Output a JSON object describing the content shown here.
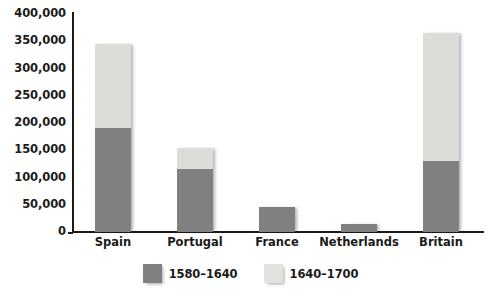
{
  "chart_data": {
    "type": "bar",
    "subtype": "stacked",
    "title": "",
    "xlabel": "",
    "ylabel": "",
    "categories": [
      "Spain",
      "Portugal",
      "France",
      "Netherlands",
      "Britain"
    ],
    "series": [
      {
        "name": "1580–1640",
        "color": "#808080",
        "values": [
          190000,
          115000,
          45000,
          15000,
          130000
        ]
      },
      {
        "name": "1640–1700",
        "color": "#dcdcd8",
        "values": [
          155000,
          40000,
          0,
          0,
          235000
        ]
      }
    ],
    "totals": [
      345000,
      155000,
      45000,
      15000,
      365000
    ],
    "ylim": [
      0,
      400000
    ],
    "yticks": [
      0,
      50000,
      100000,
      150000,
      200000,
      250000,
      300000,
      350000,
      400000
    ],
    "ytick_labels": [
      "0",
      "50,000",
      "100,000",
      "150,000",
      "200,000",
      "250,000",
      "300,000",
      "350,000",
      "400,000"
    ],
    "grid": false,
    "legend_position": "bottom"
  },
  "legend": {
    "items": [
      {
        "label": "1580–1640",
        "swatch": "dark-gray-swatch"
      },
      {
        "label": "1640–1700",
        "swatch": "light-gray-swatch"
      }
    ]
  },
  "colors": {
    "series_early": "#808080",
    "series_late": "#dcdcd8",
    "axis": "#1a1a1a",
    "background": "#ffffff"
  }
}
